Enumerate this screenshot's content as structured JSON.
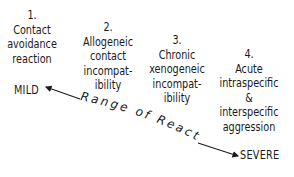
{
  "diagram": {
    "stages": [
      {
        "number": "1.",
        "lines": [
          "Contact",
          "avoidance",
          "reaction"
        ]
      },
      {
        "number": "2.",
        "lines": [
          "Allogeneic",
          "contact",
          "incompat-",
          "ibility"
        ]
      },
      {
        "number": "3.",
        "lines": [
          "Chronic",
          "xenogeneic",
          "incompat-",
          "ibility"
        ]
      },
      {
        "number": "4.",
        "lines": [
          "Acute",
          "intraspecific",
          "&",
          "interspecific",
          "aggression"
        ]
      }
    ],
    "scale": {
      "start_label": "MILD",
      "end_label": "SEVERE",
      "axis_label": "Range of Reactions"
    },
    "colors": {
      "ink": "#1a1a1a",
      "background": "#ffffff"
    }
  }
}
